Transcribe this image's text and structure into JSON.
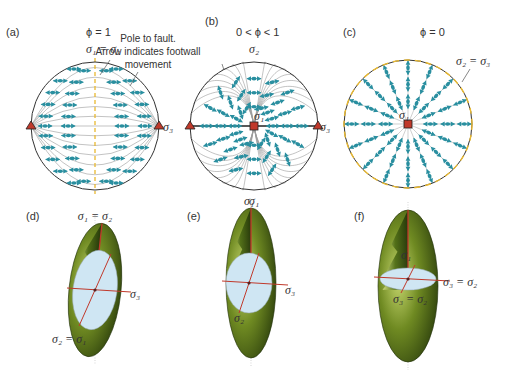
{
  "colors": {
    "arrow": "#2a8fa0",
    "trace": "#9a9a9a",
    "primitive": "#333333",
    "yellow": "#e8b830",
    "marker": "#c0392b",
    "ellipsoid_dark": "#2f4a10",
    "ellipsoid_light": "#c8d870",
    "section": "#cfe6f3",
    "axis_red": "#c0392b"
  },
  "panels": [
    {
      "id": "a",
      "label": "(a)",
      "phi_label": "ϕ = 1",
      "sigma_top": "σ₁ = σ₂",
      "sigma_right": "σ₃",
      "pattern": "phi1"
    },
    {
      "id": "b",
      "label": "(b)",
      "phi_label": "0 < ϕ < 1",
      "sigma_top": "σ₂",
      "sigma_left": "σ₃",
      "sigma_right": "σ₃",
      "sigma_center": "σ₁",
      "sigma_bottom": "σ₁",
      "pattern": "intermediate"
    },
    {
      "id": "c",
      "label": "(c)",
      "phi_label": "ϕ = 0",
      "sigma_ring": "σ₂ = σ₃",
      "sigma_center": "σ₁",
      "pattern": "phi0"
    }
  ],
  "annotation": {
    "line1": "Pole to fault.",
    "line2": "Arrow indicates footwall",
    "line3": "movement"
  },
  "ellipsoids": [
    {
      "id": "d",
      "label": "(d)",
      "top": "σ₁ = σ₂",
      "right": "σ₃",
      "bottom": "σ₂ = σ₁"
    },
    {
      "id": "e",
      "label": "(e)",
      "top": "σ₁",
      "right": "σ₃",
      "bottom": "σ₂"
    },
    {
      "id": "f",
      "label": "(f)",
      "center": "σ₁",
      "right": "σ₃ = σ₂",
      "bottom": "σ₃ = σ₂"
    }
  ]
}
